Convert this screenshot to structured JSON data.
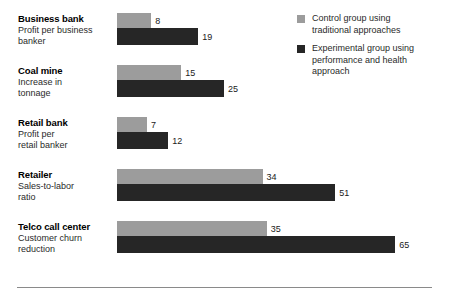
{
  "chart_data": {
    "type": "bar",
    "orientation": "horizontal",
    "title": "",
    "subtitle": "",
    "xlabel": "",
    "ylabel": "",
    "grid": false,
    "xlim": [
      0,
      65
    ],
    "legend_position": "top-right",
    "categories": [
      "Business bank",
      "Coal mine",
      "Retail bank",
      "Retailer",
      "Telco call center"
    ],
    "category_descriptions": [
      "Profit per business banker",
      "Increase in tonnage",
      "Profit per retail banker",
      "Sales-to-labor ratio",
      "Customer churn reduction"
    ],
    "series": [
      {
        "name": "Control group using traditional approaches",
        "color": "#9c9c9c",
        "values": [
          8,
          15,
          7,
          34,
          35
        ]
      },
      {
        "name": "Experimental group using performance and health approach",
        "color": "#262626",
        "values": [
          19,
          25,
          12,
          51,
          65
        ]
      }
    ]
  },
  "rows": [
    {
      "title": "Business bank",
      "sub_line1": "Profit per business",
      "sub_line2": "banker",
      "light_value": "8",
      "dark_value": "19"
    },
    {
      "title": "Coal mine",
      "sub_line1": "Increase in",
      "sub_line2": "tonnage",
      "light_value": "15",
      "dark_value": "25"
    },
    {
      "title": "Retail bank",
      "sub_line1": "Profit per",
      "sub_line2": "retail banker",
      "light_value": "7",
      "dark_value": "12"
    },
    {
      "title": "Retailer",
      "sub_line1": "Sales-to-labor",
      "sub_line2": "ratio",
      "light_value": "34",
      "dark_value": "51"
    },
    {
      "title": "Telco call center",
      "sub_line1": "Customer churn",
      "sub_line2": "reduction",
      "light_value": "35",
      "dark_value": "65"
    }
  ],
  "legend": {
    "items": [
      {
        "swatch": "light",
        "line1": "Control group using",
        "line2": "traditional approaches",
        "line3": ""
      },
      {
        "swatch": "dark",
        "line1": "Experimental group using",
        "line2": "performance and health",
        "line3": "approach"
      }
    ]
  },
  "colors": {
    "control": "#9c9c9c",
    "experimental": "#262626",
    "rule": "#8a8a8a",
    "background": "#ffffff"
  }
}
